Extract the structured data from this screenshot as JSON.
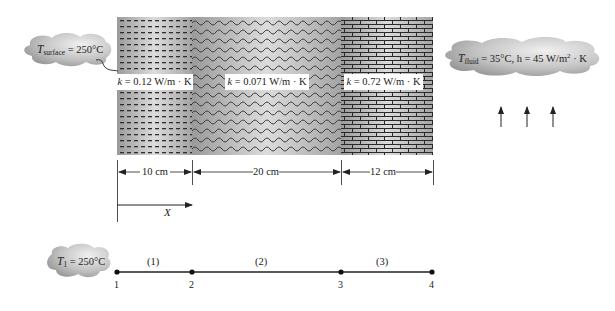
{
  "diagram": {
    "left_boundary": {
      "symbol": "T",
      "subscript": "surface",
      "text": "= 250°C"
    },
    "right_boundary": {
      "symbol": "T",
      "subscript": "fluid",
      "text_temp": "= 35°C, h = 45 W/m",
      "text_sup": "2",
      "text_tail": " · K"
    },
    "layers": [
      {
        "id": 1,
        "pattern": "dashes",
        "k_symbol": "k",
        "k_text": " = 0.12 W/m · K",
        "thickness": "10 cm"
      },
      {
        "id": 2,
        "pattern": "waves",
        "k_symbol": "k",
        "k_text": " = 0.071 W/m · K",
        "thickness": "20 cm"
      },
      {
        "id": 3,
        "pattern": "bricks",
        "k_symbol": "k",
        "k_text": " = 0.72 W/m · K",
        "thickness": "12 cm"
      }
    ],
    "axis_label": "X",
    "convection_arrows": 3,
    "node_model": {
      "boundary": {
        "symbol": "T",
        "subscript": "1",
        "text": " = 250°C"
      },
      "nodes": [
        "1",
        "2",
        "3",
        "4"
      ],
      "elements": [
        "(1)",
        "(2)",
        "(3)"
      ]
    },
    "colors": {
      "ink": "#222222",
      "cloud_light": "#e6e6e6",
      "cloud_dark": "#9a9a9a",
      "wall_light": "#d8d8d8",
      "wall_dark": "#8c8c8c"
    }
  }
}
